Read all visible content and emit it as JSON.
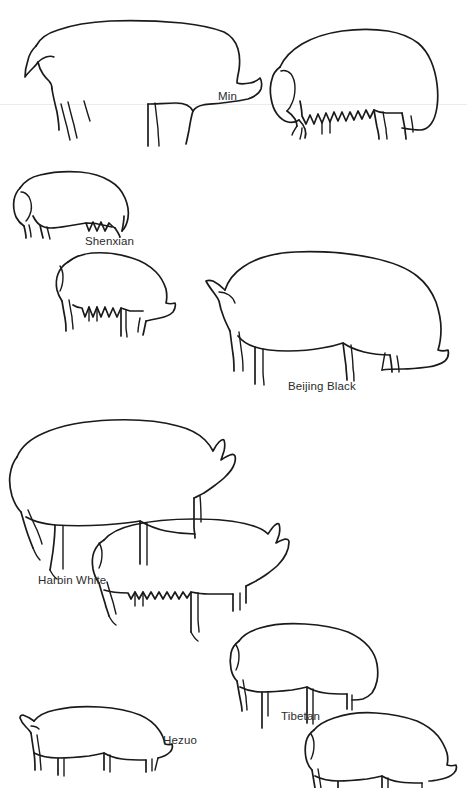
{
  "figure": {
    "background_color": "#ffffff",
    "ink_color": "#1a1a1a",
    "width": 467,
    "height": 788,
    "scan_line_color": "#ececec",
    "scan_line_y": 104
  },
  "labels": [
    {
      "text": "Min",
      "x": 218,
      "y": 91,
      "for": "min"
    },
    {
      "text": "Shenxian",
      "x": 85,
      "y": 236,
      "for": "shenxian"
    },
    {
      "text": "Beijing Black",
      "x": 288,
      "y": 381,
      "for": "beijing-black"
    },
    {
      "text": "Harbin White",
      "x": 38,
      "y": 575,
      "for": "harbin-white"
    },
    {
      "text": "Tibetan",
      "x": 281,
      "y": 711,
      "for": "tibetan"
    },
    {
      "text": "Hezuo",
      "x": 163,
      "y": 735,
      "for": "hezuo"
    }
  ],
  "breeds": [
    {
      "id": "min",
      "name": "Min",
      "drawings": 2,
      "note": "top row: boar facing right, sow facing left with teats"
    },
    {
      "id": "shenxian",
      "name": "Shenxian",
      "drawings": 2,
      "note": "small compact pig facing left, sow facing right with teats"
    },
    {
      "id": "beijing-black",
      "name": "Beijing Black",
      "drawings": 1,
      "note": "large pig facing right"
    },
    {
      "id": "harbin-white",
      "name": "Harbin White",
      "drawings": 2,
      "note": "large pig facing right, sow facing right with teats"
    },
    {
      "id": "tibetan",
      "name": "Tibetan",
      "drawings": 2,
      "note": "compact pig facing right, second pig lower right"
    },
    {
      "id": "hezuo",
      "name": "Hezuo",
      "drawings": 1,
      "note": "small pig facing right, cropped at bottom edge"
    }
  ]
}
